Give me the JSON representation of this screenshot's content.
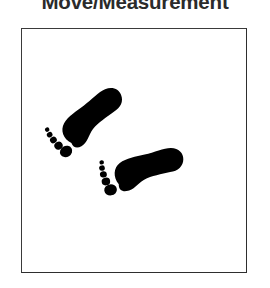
{
  "header": {
    "title": "Move/Measurement",
    "title_color": "#2b2b2b",
    "title_clipped": true
  },
  "panel": {
    "name": "illustration-frame",
    "background_color": "#ffffff",
    "border_color": "#3a3a3a",
    "border_width_px": 1,
    "bounds": {
      "x": 21,
      "y": 28,
      "width": 226,
      "height": 245
    }
  },
  "illustration": {
    "subject": "barefoot-footprints",
    "description": "Two black barefoot footprints walking diagonally",
    "ink_color": "#000000",
    "footprint_count": 2,
    "toes_per_foot": 5,
    "footprints": [
      {
        "name": "footprint-upper-left",
        "order": 1,
        "side": "right",
        "rotation_deg": -31,
        "center": {
          "x": 88,
          "y": 122
        },
        "scale": 1.0
      },
      {
        "name": "footprint-lower-right",
        "order": 2,
        "side": "right",
        "rotation_deg": -8,
        "center": {
          "x": 143,
          "y": 172
        },
        "scale": 1.0
      }
    ]
  },
  "canvas": {
    "width": 270,
    "height": 288,
    "background_color": "#ffffff"
  }
}
